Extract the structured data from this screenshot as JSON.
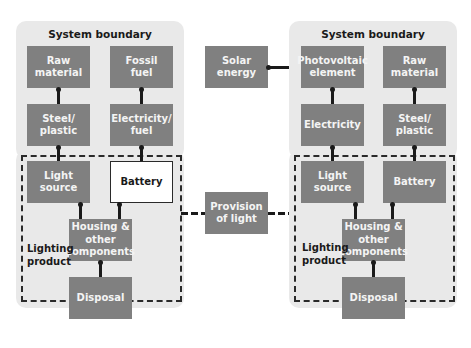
{
  "left_system": {
    "title": "System boundary",
    "boxes": {
      "raw_material": "Raw\nmaterial",
      "fossil_fuel": "Fossil\nfuel",
      "steel_plastic": "Steel/\nplastic",
      "electricity_fuel": "Electricity/\nfuel",
      "light_source": "Light source",
      "battery": "Battery",
      "housing": "Housing &\nother\ncomponents",
      "disposal": "Disposal"
    },
    "product_label": "Lighting\nproduct"
  },
  "center": {
    "solar_energy": "Solar energy",
    "provision_of_light": "Provision\nof light"
  },
  "right_system": {
    "title": "System boundary",
    "boxes": {
      "photovoltaic": "Photovoltaic\nelement",
      "raw_material": "Raw\nmaterial",
      "electricity": "Electricity",
      "steel_plastic": "Steel/\nplastic",
      "light_source": "Light source",
      "battery": "Battery",
      "housing": "Housing &\nother\ncomponents",
      "disposal": "Disposal"
    },
    "product_label": "Lighting\nproduct"
  },
  "colors": {
    "boundary_bg": "#e9e9e9",
    "box_gray": "#808080",
    "box_text": "#f4f4f4",
    "line": "#1a1a1a"
  }
}
